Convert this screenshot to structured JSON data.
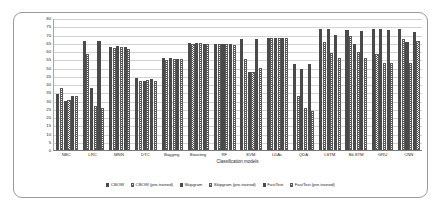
{
  "chart_data": {
    "type": "bar",
    "title": "",
    "xlabel": "Classification models",
    "ylabel": "",
    "ylim": [
      0,
      80
    ],
    "ytick_step": 5,
    "yticks": [
      80,
      75,
      70,
      65,
      60,
      55,
      50,
      45,
      40,
      35,
      30,
      25,
      20,
      15,
      10,
      5,
      0
    ],
    "grid": true,
    "legend_position": "bottom",
    "categories": [
      "NBC",
      "LRC",
      "MNN",
      "DTC",
      "Bagging",
      "Boosting",
      "RF",
      "SVM",
      "LDAc",
      "QDA",
      "LSTM",
      "BiLSTM",
      "GRU",
      "CNN"
    ],
    "series": [
      {
        "name": "CBOW",
        "values": [
          34,
          66,
          62.5,
          43.5,
          56,
          65,
          64.5,
          67.5,
          68,
          52,
          73.5,
          72.5,
          73.5,
          73.5
        ]
      },
      {
        "name": "CBOW (pre-trained)",
        "values": [
          37.5,
          58,
          62,
          42,
          54.5,
          64.5,
          64,
          55,
          68,
          33,
          65.5,
          69,
          58,
          67
        ]
      },
      {
        "name": "Skipgram",
        "values": [
          29.5,
          37.5,
          63,
          42,
          56,
          65,
          64.5,
          47.5,
          68,
          49,
          73.5,
          64.5,
          73.5,
          65.5
        ]
      },
      {
        "name": "Skipgram (pre-trained)",
        "values": [
          30.5,
          26.5,
          62.5,
          42.5,
          55,
          65,
          64.5,
          47.5,
          68,
          25.5,
          59,
          59.5,
          53,
          53
        ]
      },
      {
        "name": "FastText",
        "values": [
          32.5,
          66,
          62.5,
          43,
          55,
          64,
          64.5,
          67.5,
          68,
          52,
          70,
          72,
          72.5,
          71.5
        ]
      },
      {
        "name": "FastText (pre-trained)",
        "values": [
          33,
          25.5,
          61,
          42,
          55,
          64,
          63.5,
          50,
          68,
          23.5,
          56,
          55.5,
          52.5,
          66
        ]
      }
    ]
  }
}
